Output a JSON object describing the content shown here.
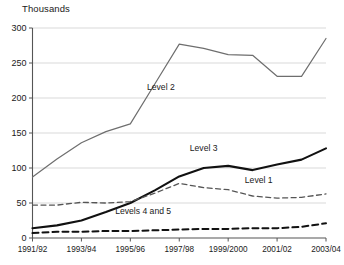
{
  "chart_data": {
    "type": "line",
    "title": "",
    "ylabel": "Thousands",
    "xlabel": "",
    "ylim": [
      0,
      300
    ],
    "ytick_values": [
      0,
      50,
      100,
      150,
      200,
      250,
      300
    ],
    "ytick_labels": [
      "0",
      "50",
      "100",
      "150",
      "200",
      "250",
      "300"
    ],
    "grid": "horizontal",
    "legend_position": "inline-annotations",
    "x": [
      "1991/92",
      "1992/93",
      "1993/94",
      "1994/95",
      "1995/96",
      "1996/97",
      "1997/98",
      "1998/99",
      "1999/2000",
      "2000/01",
      "2001/02",
      "2002/03",
      "2003/04"
    ],
    "xtick_labels": [
      "1991/92",
      "1993/94",
      "1995/96",
      "1997/98",
      "1999/2000",
      "2001/02",
      "2003/04"
    ],
    "xtick_indices": [
      0,
      2,
      4,
      6,
      8,
      10,
      12
    ],
    "series": [
      {
        "name": "Level 2",
        "style": "solid",
        "color": "#6e6e6e",
        "width": 1.2,
        "values": [
          87,
          113,
          136,
          152,
          163,
          220,
          277,
          271,
          262,
          261,
          231,
          231,
          285
        ],
        "label_x_index": 4.6,
        "label_y_value": 212
      },
      {
        "name": "Level 3",
        "style": "solid",
        "color": "#111111",
        "width": 2.1,
        "values": [
          14,
          18,
          25,
          37,
          50,
          68,
          88,
          100,
          103,
          97,
          105,
          112,
          128
        ],
        "label_x_index": 6.35,
        "label_y_value": 124
      },
      {
        "name": "Level 1",
        "style": "dashed",
        "color": "#555555",
        "width": 1.3,
        "values": [
          47,
          47,
          51,
          50,
          52,
          64,
          78,
          72,
          69,
          60,
          57,
          58,
          63
        ],
        "label_x_index": 8.6,
        "label_y_value": 78
      },
      {
        "name": "Levels 4 and 5",
        "style": "dashed",
        "color": "#111111",
        "width": 2.0,
        "values": [
          7,
          9,
          9,
          10,
          10,
          11,
          12,
          13,
          13,
          14,
          14,
          16,
          21
        ],
        "label_x_index": 3.3,
        "label_y_value": 34
      }
    ]
  }
}
